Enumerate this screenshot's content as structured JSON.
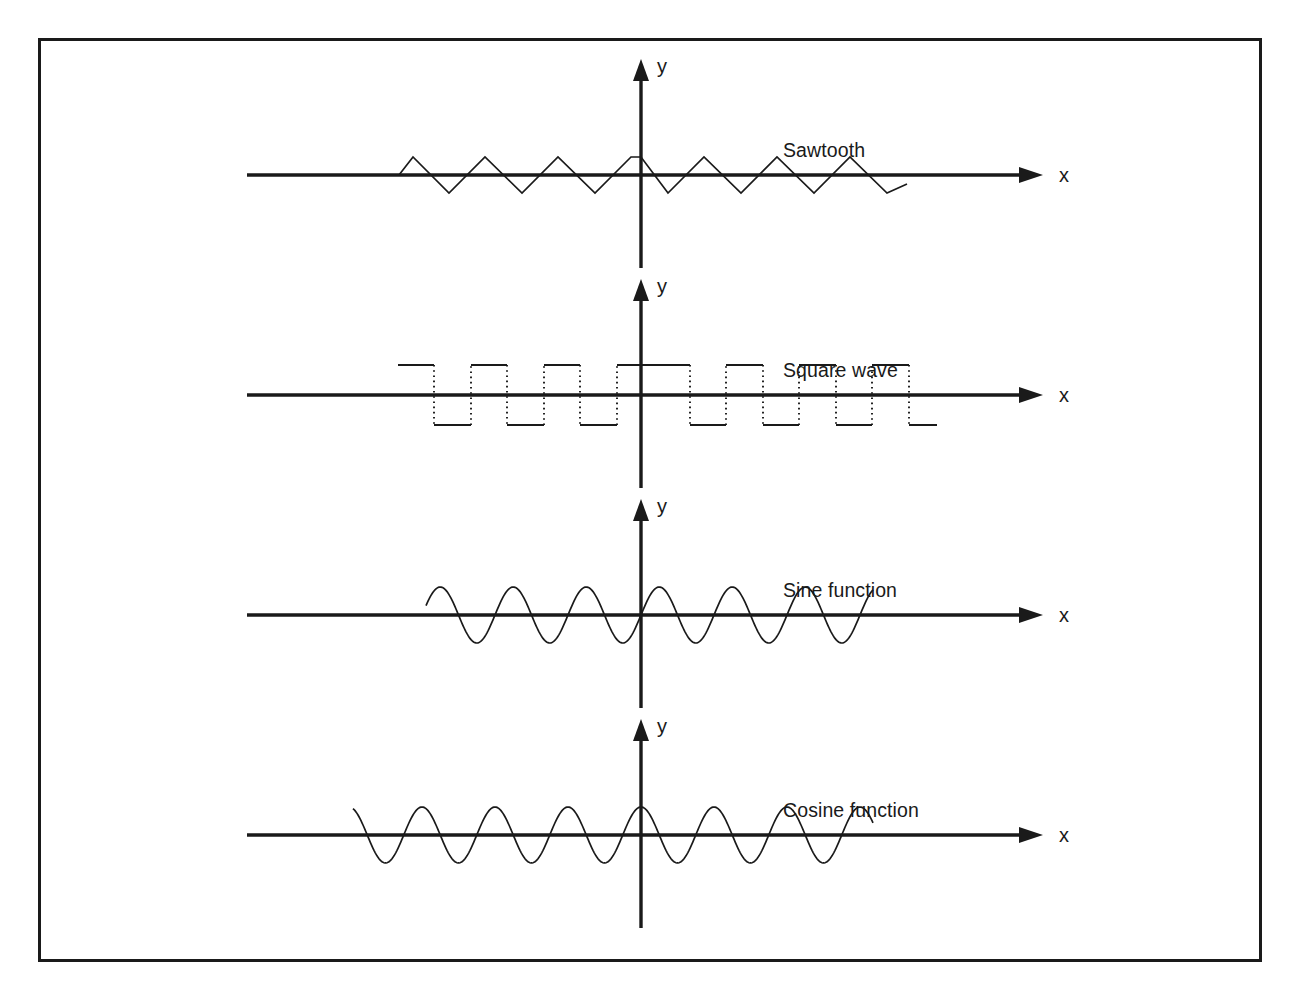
{
  "figure": {
    "background_color": "#ffffff",
    "line_color": "#1a1a1a",
    "border_color": "#1a1a1a"
  },
  "panels": [
    {
      "id": "sawtooth",
      "caption": "Sawtooth",
      "x_axis_label": "x",
      "y_axis_label": "y"
    },
    {
      "id": "square",
      "caption": "Square wave",
      "x_axis_label": "x",
      "y_axis_label": "y"
    },
    {
      "id": "sine",
      "caption": "Sine function",
      "x_axis_label": "x",
      "y_axis_label": "y"
    },
    {
      "id": "cosine",
      "caption": "Cosine function",
      "x_axis_label": "x",
      "y_axis_label": "y"
    }
  ],
  "chart_data": [
    {
      "type": "line",
      "id": "sawtooth",
      "title": "Sawtooth",
      "xlabel": "x",
      "ylabel": "y",
      "grid": false,
      "legend": "none",
      "waveform": "triangle",
      "amplitude": 1.0,
      "period": 1.0,
      "phase_at_origin": "peak",
      "cycles_drawn": 7,
      "x_range": [
        -3.5,
        3.5
      ],
      "y_range": [
        -1.0,
        1.0
      ],
      "description": "Triangular sawtooth wave, apex on the y-axis, symmetric rising and falling ramps",
      "x": [
        -3.5,
        -3.25,
        -2.75,
        -2.25,
        -1.75,
        -1.25,
        -0.75,
        -0.25,
        0.0,
        0.25,
        0.75,
        1.25,
        1.75,
        2.25,
        2.75,
        3.25,
        3.5
      ],
      "values": [
        0.0,
        1.0,
        -1.0,
        1.0,
        -1.0,
        1.0,
        -1.0,
        1.0,
        1.0,
        1.0,
        -1.0,
        1.0,
        -1.0,
        1.0,
        -1.0,
        1.0,
        -0.4
      ]
    },
    {
      "type": "line",
      "id": "square",
      "title": "Square wave",
      "xlabel": "x",
      "ylabel": "y",
      "grid": false,
      "legend": "none",
      "waveform": "square",
      "amplitude": 1.0,
      "period": 1.0,
      "duty_cycle": 0.5,
      "phase_at_origin": "high",
      "cycles_drawn": 7,
      "x_range": [
        -3.5,
        3.5
      ],
      "y_range": [
        -1.0,
        1.0
      ],
      "line_style": "solid horizontals with dotted vertical transitions",
      "x": [
        -3.5,
        -3.0,
        -3.0,
        -2.5,
        -2.5,
        -2.0,
        -2.0,
        -1.5,
        -1.5,
        -1.0,
        -1.0,
        -0.5,
        -0.5,
        0.0,
        0.0,
        0.5,
        0.5,
        1.0,
        1.0,
        1.5,
        1.5,
        2.0,
        2.0,
        2.5,
        2.5,
        3.0,
        3.0,
        3.5
      ],
      "values": [
        1.0,
        1.0,
        -1.0,
        -1.0,
        1.0,
        1.0,
        -1.0,
        -1.0,
        1.0,
        1.0,
        -1.0,
        -1.0,
        1.0,
        1.0,
        1.0,
        1.0,
        -1.0,
        -1.0,
        1.0,
        1.0,
        -1.0,
        -1.0,
        1.0,
        1.0,
        -1.0,
        -1.0,
        -1.0,
        -1.0
      ]
    },
    {
      "type": "line",
      "id": "sine",
      "title": "Sine function",
      "xlabel": "x",
      "ylabel": "y",
      "grid": false,
      "legend": "none",
      "waveform": "sine",
      "function": "y = sin(x)",
      "amplitude": 1.0,
      "period": 1.0,
      "phase_at_origin": "zero rising",
      "cycles_drawn": 6.5,
      "x_range": [
        -3.0,
        3.3
      ],
      "y_range": [
        -1.0,
        1.0
      ]
    },
    {
      "type": "line",
      "id": "cosine",
      "title": "Cosine function",
      "xlabel": "x",
      "ylabel": "y",
      "grid": false,
      "legend": "none",
      "waveform": "cosine",
      "function": "y = cos(x)",
      "amplitude": 1.0,
      "period": 1.0,
      "phase_at_origin": "peak",
      "cycles_drawn": 6.5,
      "x_range": [
        -3.0,
        3.3
      ],
      "y_range": [
        -1.0,
        1.0
      ]
    }
  ]
}
